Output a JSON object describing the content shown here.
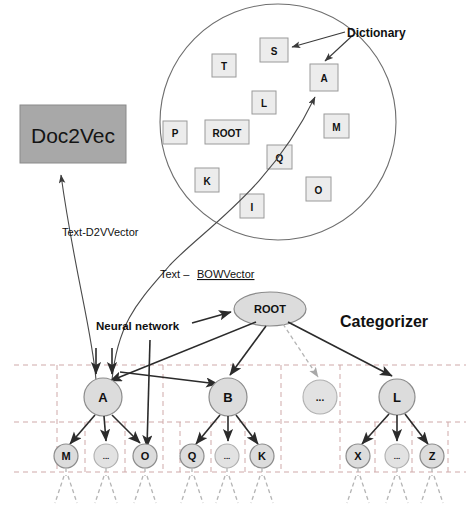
{
  "figure": {
    "type": "system-architecture-diagram",
    "background_color": "#ffffff"
  },
  "doc2vec": {
    "label": "Doc2Vec",
    "fill_color": "#a8a8a8",
    "x": 20,
    "y": 105,
    "w": 106,
    "h": 58
  },
  "dictionary": {
    "label": "Dictionary",
    "circle": {
      "cx": 278,
      "cy": 122,
      "r": 118
    },
    "words": [
      {
        "text": "S",
        "x": 260,
        "y": 38,
        "w": 28,
        "h": 24
      },
      {
        "text": "T",
        "x": 212,
        "y": 54,
        "w": 24,
        "h": 23
      },
      {
        "text": "A",
        "x": 310,
        "y": 64,
        "w": 28,
        "h": 27
      },
      {
        "text": "L",
        "x": 252,
        "y": 91,
        "w": 24,
        "h": 23
      },
      {
        "text": "P",
        "x": 163,
        "y": 121,
        "w": 24,
        "h": 23
      },
      {
        "text": "ROOT",
        "x": 205,
        "y": 120,
        "w": 44,
        "h": 24
      },
      {
        "text": "M",
        "x": 324,
        "y": 114,
        "w": 25,
        "h": 24
      },
      {
        "text": "Q",
        "x": 267,
        "y": 145,
        "w": 25,
        "h": 24
      },
      {
        "text": "K",
        "x": 195,
        "y": 168,
        "w": 24,
        "h": 24
      },
      {
        "text": "O",
        "x": 306,
        "y": 177,
        "w": 25,
        "h": 24
      },
      {
        "text": "I",
        "x": 240,
        "y": 194,
        "w": 24,
        "h": 24
      }
    ]
  },
  "edge_labels": {
    "d2v_vector": "Text-D2VVector",
    "bow_vector_prefix": "Text – ",
    "bow_vector_underlined": "BOWVector",
    "neural_network": "Neural network"
  },
  "categorizer": {
    "label": "Categorizer",
    "root": {
      "text": "ROOT",
      "cx": 270,
      "cy": 309,
      "rx": 36,
      "ry": 17
    },
    "level2": [
      {
        "text": "A",
        "cx": 103,
        "cy": 397,
        "r": 19,
        "dim": false
      },
      {
        "text": "B",
        "cx": 228,
        "cy": 397,
        "r": 19,
        "dim": false
      },
      {
        "text": "...",
        "cx": 320,
        "cy": 397,
        "r": 17,
        "dim": true
      },
      {
        "text": "L",
        "cx": 397,
        "cy": 397,
        "r": 18,
        "dim": false
      }
    ],
    "level3": [
      {
        "text": "M",
        "cx": 66,
        "cy": 456,
        "r": 12,
        "dim": false,
        "parent": 0
      },
      {
        "text": "...",
        "cx": 106,
        "cy": 456,
        "r": 12,
        "dim": true,
        "parent": 0
      },
      {
        "text": "O",
        "cx": 145,
        "cy": 456,
        "r": 12,
        "dim": false,
        "parent": 0
      },
      {
        "text": "Q",
        "cx": 192,
        "cy": 456,
        "r": 12,
        "dim": false,
        "parent": 1
      },
      {
        "text": "...",
        "cx": 227,
        "cy": 456,
        "r": 12,
        "dim": true,
        "parent": 1
      },
      {
        "text": "K",
        "cx": 262,
        "cy": 456,
        "r": 12,
        "dim": false,
        "parent": 1
      },
      {
        "text": "X",
        "cx": 358,
        "cy": 456,
        "r": 12,
        "dim": false,
        "parent": 3
      },
      {
        "text": "...",
        "cx": 397,
        "cy": 456,
        "r": 12,
        "dim": true,
        "parent": 3
      },
      {
        "text": "Z",
        "cx": 432,
        "cy": 456,
        "r": 12,
        "dim": false,
        "parent": 3
      }
    ],
    "grid": {
      "h_lines_y": [
        365,
        422,
        472
      ],
      "v_lines_x": [
        57,
        85,
        125,
        163,
        180,
        240,
        272,
        292,
        340,
        375,
        412,
        448
      ],
      "color": "#cfa9a9"
    }
  }
}
